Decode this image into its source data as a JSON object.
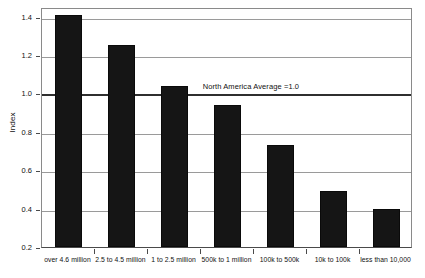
{
  "chart_data": {
    "type": "bar",
    "title": "",
    "xlabel": "",
    "ylabel": "Index",
    "ylim": [
      0.2,
      1.45
    ],
    "yticks": [
      0.2,
      0.4,
      0.6,
      0.8,
      1.0,
      1.2,
      1.4
    ],
    "ytick_labels": [
      "0.2",
      "0.4",
      "0.6",
      "0.8",
      "1.0",
      "1.2",
      "1.4"
    ],
    "grid": true,
    "legend": "none",
    "categories": [
      "over 4.6 million",
      "2.5 to 4.5 million",
      "1 to 2.5 million",
      "500k to 1 million",
      "100k to 500k",
      "10k to 100k",
      "less than 10,000"
    ],
    "values": [
      1.41,
      1.25,
      1.04,
      0.94,
      0.73,
      0.49,
      0.4
    ],
    "bar_color": "#151515",
    "annotations": [
      {
        "text": "North America Average =1.0",
        "y_value": 1.0,
        "note": "emphasized horizontal reference line at index 1.0"
      }
    ]
  },
  "axis": {
    "y_title": "Index",
    "reference_line_label": "North America Average =1.0"
  },
  "colors": {
    "bar": "#151515",
    "grid": "#9a9a9a",
    "reference_line": "#2f2f2f",
    "frame": "#8a8a8a",
    "text": "#111111",
    "background": "#ffffff"
  }
}
